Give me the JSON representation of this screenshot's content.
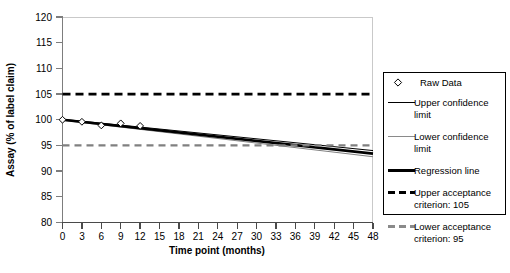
{
  "chart_data": {
    "type": "line",
    "title": "",
    "xlabel": "Time point (months)",
    "ylabel": "Assay (% of label claim)",
    "xlim": [
      0,
      48
    ],
    "ylim": [
      80,
      120
    ],
    "xticks": [
      0,
      3,
      6,
      9,
      12,
      15,
      18,
      21,
      24,
      27,
      30,
      33,
      36,
      39,
      42,
      45,
      48
    ],
    "yticks": [
      80,
      85,
      90,
      95,
      100,
      105,
      110,
      115,
      120
    ],
    "xtick_labels": [
      "0",
      "3",
      "6",
      "9",
      "12",
      "15",
      "18",
      "21",
      "24",
      "27",
      "30",
      "33",
      "36",
      "39",
      "42",
      "45",
      "48"
    ],
    "ytick_labels": [
      "80",
      "85",
      "90",
      "95",
      "100",
      "105",
      "110",
      "115",
      "120"
    ],
    "grid": false,
    "legend_position": "right-outside",
    "series": [
      {
        "name": "Raw Data",
        "kind": "scatter",
        "marker": "diamond",
        "color": "#000000",
        "x": [
          0,
          3,
          6,
          9,
          12
        ],
        "values": [
          100.0,
          99.6,
          98.9,
          99.3,
          98.8
        ]
      },
      {
        "name": "Upper confidence limit",
        "kind": "line",
        "color": "#000000",
        "width": 1,
        "x": [
          0,
          48
        ],
        "values": [
          100.1,
          94.0
        ]
      },
      {
        "name": "Lower confidence limit",
        "kind": "line",
        "color": "#808080",
        "width": 1,
        "x": [
          0,
          48
        ],
        "values": [
          99.9,
          92.8
        ]
      },
      {
        "name": "Regression line",
        "kind": "line",
        "color": "#000000",
        "width": 2.6,
        "x": [
          0,
          48
        ],
        "values": [
          100.0,
          93.4
        ]
      },
      {
        "name": "Upper acceptance criterion: 105",
        "kind": "dashed-line",
        "color": "#000000",
        "width": 2.8,
        "x": [
          0,
          48
        ],
        "values": [
          105,
          105
        ]
      },
      {
        "name": "Lower acceptance criterion: 95",
        "kind": "dashed-line",
        "color": "#808080",
        "width": 2.2,
        "x": [
          0,
          48
        ],
        "values": [
          95,
          95
        ]
      }
    ],
    "legend_entries": [
      {
        "label_line1": "Raw Data",
        "label_line2": "",
        "swatch": "diamond"
      },
      {
        "label_line1": "Upper confidence",
        "label_line2": "limit",
        "swatch": "thin-black-line"
      },
      {
        "label_line1": "Lower confidence",
        "label_line2": "limit",
        "swatch": "thin-gray-line"
      },
      {
        "label_line1": "Regression line",
        "label_line2": "",
        "swatch": "thick-black-line"
      },
      {
        "label_line1": "Upper acceptance",
        "label_line2": "criterion: 105",
        "swatch": "black-dashed-line"
      },
      {
        "label_line1": "Lower acceptance",
        "label_line2": "criterion: 95",
        "swatch": "gray-dashed-line"
      }
    ],
    "colors": {
      "regression": "#000000",
      "upper_confidence": "#000000",
      "lower_confidence": "#808080",
      "upper_acceptance": "#000000",
      "lower_acceptance": "#808080",
      "axis": "#808080",
      "text": "#000000"
    }
  }
}
